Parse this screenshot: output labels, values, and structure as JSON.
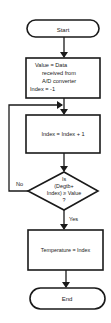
{
  "flowchart": {
    "start": {
      "label": "Start"
    },
    "init": {
      "lines": [
        "Value = Data",
        "received from",
        "A/D converter",
        "Index = -1"
      ]
    },
    "increment": {
      "label": "Index = Index + 1"
    },
    "decision": {
      "lines": [
        "Is",
        "(Degtb+",
        "Index) ≥  Value",
        "?"
      ],
      "no_label": "No",
      "yes_label": "Yes"
    },
    "assign": {
      "label": "Temperature = Index"
    },
    "end": {
      "label": "End"
    }
  },
  "colors": {
    "stroke": "#1a1a1a",
    "background": "#ffffff"
  }
}
